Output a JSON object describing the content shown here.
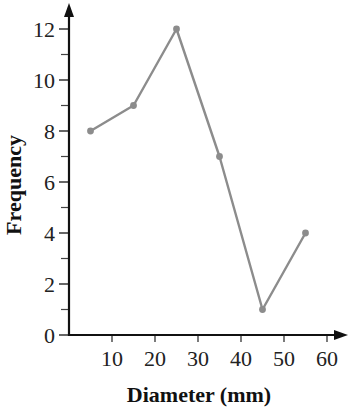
{
  "chart_data": {
    "type": "line",
    "title": "",
    "xlabel": "Diameter (mm)",
    "ylabel": "Frequency",
    "x": [
      5,
      15,
      25,
      35,
      45,
      55
    ],
    "values": [
      8,
      9,
      12,
      7,
      1,
      4
    ],
    "series": [
      {
        "name": "Frequency",
        "x": [
          5,
          15,
          25,
          35,
          45,
          55
        ],
        "values": [
          8,
          9,
          12,
          7,
          1,
          4
        ]
      }
    ],
    "xlim": [
      0,
      64
    ],
    "ylim": [
      0,
      13.5
    ],
    "x_ticks": [
      10,
      20,
      30,
      40,
      50,
      60
    ],
    "x_tick_labels": [
      "10",
      "20",
      "30",
      "40",
      "50",
      "60"
    ],
    "y_major_ticks": [
      0,
      2,
      4,
      6,
      8,
      10,
      12
    ],
    "y_tick_labels": [
      "0",
      "2",
      "4",
      "6",
      "8",
      "10",
      "12"
    ],
    "y_minor_ticks": [
      1,
      3,
      5,
      7,
      9,
      11
    ],
    "grid": false,
    "legend": null,
    "line_color": "#8c8c8c",
    "axis_color": "#111111"
  }
}
